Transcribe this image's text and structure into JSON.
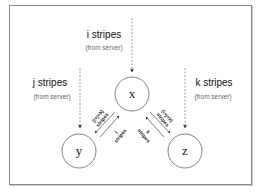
{
  "diagram": {
    "nodes": {
      "x": {
        "label": "x"
      },
      "y": {
        "label": "y"
      },
      "z": {
        "label": "z"
      }
    },
    "sources": {
      "i": {
        "title": "i stripes",
        "subtitle": "(from server)"
      },
      "j": {
        "title": "j stripes",
        "subtitle": "(from server)"
      },
      "k": {
        "title": "k stripes",
        "subtitle": "(from server)"
      }
    },
    "edges": {
      "x_to_y": {
        "line1": "(i+j+k)",
        "line2": "stripes"
      },
      "y_to_x": {
        "line1": "j",
        "line2": "stripes"
      },
      "x_to_z": {
        "line1": "(i+j+k)",
        "line2": "stripes"
      },
      "z_to_x": {
        "line1": "k",
        "line2": "stripes"
      }
    },
    "colors": {
      "frame": "#8a8a8a",
      "circle": "#777777",
      "dashed": "#888888",
      "arrow": "#222222"
    }
  }
}
